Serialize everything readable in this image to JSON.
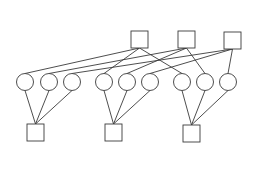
{
  "diagram": {
    "type": "bipartite-graph",
    "background": "#ffffff",
    "stroke_color": "#3a3a3a",
    "top_squares": [
      {
        "id": "T1",
        "x": 131,
        "y": 31,
        "size": 17
      },
      {
        "id": "T2",
        "x": 178,
        "y": 31,
        "size": 17
      },
      {
        "id": "T3",
        "x": 224,
        "y": 32,
        "size": 17
      }
    ],
    "circles": [
      {
        "id": "C1",
        "cx": 25,
        "cy": 82,
        "r": 8.5
      },
      {
        "id": "C2",
        "cx": 49,
        "cy": 82,
        "r": 8.5
      },
      {
        "id": "C3",
        "cx": 72,
        "cy": 82,
        "r": 8.5
      },
      {
        "id": "C4",
        "cx": 104,
        "cy": 82,
        "r": 8.5
      },
      {
        "id": "C5",
        "cx": 127,
        "cy": 82,
        "r": 8.5
      },
      {
        "id": "C6",
        "cx": 150,
        "cy": 82,
        "r": 8.5
      },
      {
        "id": "C7",
        "cx": 182,
        "cy": 82,
        "r": 8.5
      },
      {
        "id": "C8",
        "cx": 205,
        "cy": 82,
        "r": 8.5
      },
      {
        "id": "C9",
        "cx": 228,
        "cy": 82,
        "r": 8.5
      }
    ],
    "bottom_squares": [
      {
        "id": "B1",
        "x": 27,
        "y": 124,
        "size": 17
      },
      {
        "id": "B2",
        "x": 105,
        "y": 124,
        "size": 17
      },
      {
        "id": "B3",
        "x": 183,
        "y": 125,
        "size": 17
      }
    ],
    "top_edges": [
      {
        "from": "T1",
        "to": "C1"
      },
      {
        "from": "T1",
        "to": "C4"
      },
      {
        "from": "T1",
        "to": "C7"
      },
      {
        "from": "T2",
        "to": "C2"
      },
      {
        "from": "T2",
        "to": "C5"
      },
      {
        "from": "T2",
        "to": "C8"
      },
      {
        "from": "T3",
        "to": "C3"
      },
      {
        "from": "T3",
        "to": "C6"
      },
      {
        "from": "T3",
        "to": "C9"
      }
    ],
    "bottom_edges": [
      {
        "from": "C1",
        "to": "B1"
      },
      {
        "from": "C2",
        "to": "B1"
      },
      {
        "from": "C3",
        "to": "B1"
      },
      {
        "from": "C4",
        "to": "B2"
      },
      {
        "from": "C5",
        "to": "B2"
      },
      {
        "from": "C6",
        "to": "B2"
      },
      {
        "from": "C7",
        "to": "B3"
      },
      {
        "from": "C8",
        "to": "B3"
      },
      {
        "from": "C9",
        "to": "B3"
      }
    ]
  }
}
